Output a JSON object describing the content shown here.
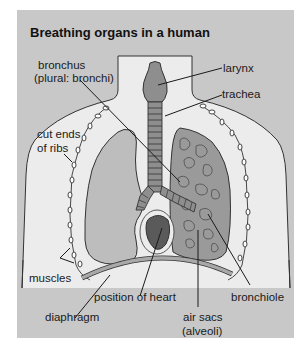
{
  "title": "Breathing organs in a human",
  "labels": {
    "bronchus_line1": "bronchus",
    "bronchus_line2": "(plural: bronchi)",
    "larynx": "larynx",
    "trachea": "trachea",
    "ribs_line1": "cut ends",
    "ribs_line2": "of ribs",
    "muscles": "muscles",
    "diaphragm": "diaphragm",
    "heart": "position of heart",
    "alveoli_line1": "air sacs",
    "alveoli_line2": "(alveoli)",
    "bronchiole": "bronchiole"
  },
  "colors": {
    "panel": "#c8c8c8",
    "body": "#ececec",
    "lung_left": "#bdbdbd",
    "lung_right": "#9a9a9a",
    "larynx": "#8e8e8e",
    "heart": "#5a5a5a",
    "diaphragm": "#a8a8a8"
  }
}
